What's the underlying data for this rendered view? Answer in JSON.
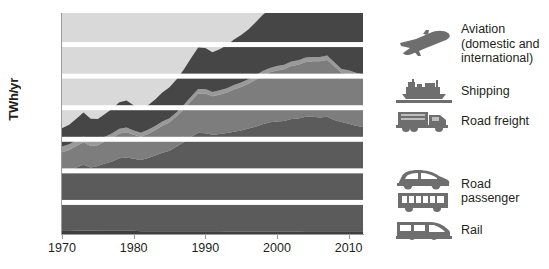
{
  "chart_data": {
    "type": "area",
    "stacked": true,
    "title": "",
    "xlabel": "",
    "ylabel": "TWh/yr",
    "xlim": [
      1970,
      2012
    ],
    "ylim": [
      0,
      700
    ],
    "xticks": [
      1970,
      1980,
      1990,
      2000,
      2010
    ],
    "yticks": [
      0,
      100,
      200,
      300,
      400,
      500,
      600,
      700
    ],
    "grid": "horizontal-white-bands",
    "legend_position": "right",
    "x": [
      1970,
      1971,
      1972,
      1973,
      1974,
      1975,
      1976,
      1977,
      1978,
      1979,
      1980,
      1981,
      1982,
      1983,
      1984,
      1985,
      1986,
      1987,
      1988,
      1989,
      1990,
      1991,
      1992,
      1993,
      1994,
      1995,
      1996,
      1997,
      1998,
      1999,
      2000,
      2001,
      2002,
      2003,
      2004,
      2005,
      2006,
      2007,
      2008,
      2009,
      2010,
      2011,
      2012
    ],
    "series": [
      {
        "name": "Rail",
        "color": "#3f3f3f",
        "values": [
          12,
          12,
          11,
          11,
          11,
          10,
          10,
          10,
          10,
          10,
          10,
          9,
          9,
          9,
          9,
          9,
          9,
          9,
          9,
          9,
          9,
          9,
          9,
          8,
          8,
          8,
          8,
          8,
          8,
          8,
          8,
          8,
          8,
          8,
          9,
          9,
          9,
          9,
          9,
          9,
          9,
          9,
          9
        ]
      },
      {
        "name": "Road passenger",
        "color": "#5b5b5b",
        "values": [
          185,
          190,
          200,
          208,
          200,
          205,
          213,
          220,
          230,
          232,
          228,
          225,
          232,
          240,
          248,
          255,
          268,
          282,
          298,
          312,
          310,
          305,
          308,
          312,
          316,
          320,
          326,
          332,
          340,
          346,
          348,
          350,
          356,
          358,
          362,
          362,
          360,
          362,
          352,
          346,
          340,
          334,
          330
        ]
      },
      {
        "name": "Road freight",
        "color": "#7d7d7d",
        "values": [
          62,
          64,
          68,
          72,
          68,
          66,
          70,
          74,
          78,
          80,
          76,
          74,
          76,
          80,
          86,
          90,
          96,
          104,
          114,
          124,
          126,
          122,
          124,
          128,
          134,
          138,
          142,
          148,
          154,
          158,
          162,
          164,
          168,
          170,
          174,
          176,
          178,
          180,
          170,
          156,
          158,
          156,
          154
        ]
      },
      {
        "name": "Shipping",
        "color": "#9a9a9a",
        "values": [
          18,
          18,
          18,
          18,
          16,
          15,
          15,
          15,
          15,
          15,
          14,
          13,
          13,
          13,
          13,
          13,
          13,
          14,
          14,
          14,
          14,
          14,
          14,
          14,
          14,
          14,
          14,
          14,
          14,
          14,
          14,
          14,
          14,
          14,
          14,
          14,
          14,
          14,
          13,
          12,
          12,
          12,
          12
        ]
      },
      {
        "name": "Aviation (domestic and international)",
        "color": "#464646",
        "values": [
          58,
          62,
          68,
          76,
          70,
          68,
          72,
          78,
          84,
          86,
          80,
          76,
          78,
          84,
          92,
          98,
          104,
          112,
          122,
          132,
          130,
          126,
          130,
          136,
          144,
          150,
          158,
          168,
          178,
          186,
          196,
          198,
          204,
          208,
          218,
          228,
          238,
          244,
          230,
          214,
          212,
          206,
          204
        ]
      }
    ]
  },
  "axis": {
    "ylabel": "TWh/yr",
    "yticks": [
      "700",
      "600",
      "500",
      "400",
      "300",
      "200",
      "100",
      "0"
    ],
    "xticks": [
      "1970",
      "1980",
      "1990",
      "2000",
      "2010"
    ]
  },
  "legend": {
    "items": [
      {
        "icon": "airplane-icon",
        "label": "Aviation\n(domestic and\ninternational)",
        "label_lines": [
          "Aviation",
          "(domestic and",
          "international)"
        ]
      },
      {
        "icon": "cargo-ship-icon",
        "label": "Shipping",
        "label_lines": [
          "Shipping"
        ]
      },
      {
        "icon": "truck-icon",
        "label": "Road freight",
        "label_lines": [
          "Road freight"
        ]
      },
      {
        "icon": "car-and-bus-icon",
        "label": "Road passenger",
        "label_lines": [
          "Road passenger"
        ]
      },
      {
        "icon": "train-icon",
        "label": "Rail",
        "label_lines": [
          "Rail"
        ]
      }
    ]
  },
  "colors": {
    "plot_background": "#d9d9d9",
    "gridline": "#ffffff",
    "axis": "#9a9a9a",
    "text": "#231f20",
    "icon": "#6e6e6e"
  }
}
